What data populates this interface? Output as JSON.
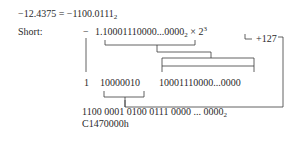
{
  "diagram": {
    "equation": {
      "lhs": "−12.4375 = −1100.0111",
      "lhs_base": "2"
    },
    "label": "Short:",
    "sign": "−",
    "normalized": {
      "mantissa": "1.10001110000...0000",
      "base_sub": "2",
      "times": " × 2",
      "exponent": "3"
    },
    "bias": "+127",
    "fields": {
      "sign_bit": "1",
      "exponent_bits": "10000010",
      "fraction_bits": "10001110000...0000"
    },
    "result": {
      "binary": "1100 0001 0100 0111 0000 ... 0000",
      "binary_base": "2",
      "hex": "C1470000h"
    },
    "line_color": "#3a3a3a"
  }
}
